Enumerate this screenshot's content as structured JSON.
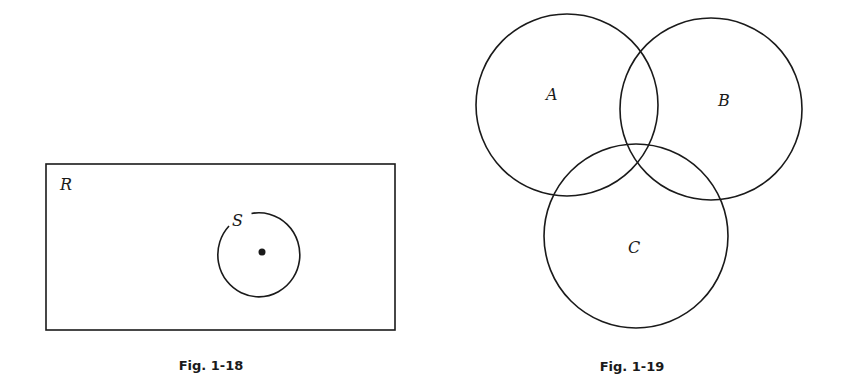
{
  "figures": [
    {
      "id": "fig-1-18",
      "caption": "Fig. 1-18",
      "region_label": "R",
      "set_label": "S",
      "has_center_point": true
    },
    {
      "id": "fig-1-19",
      "caption": "Fig. 1-19",
      "sets": [
        {
          "label": "A"
        },
        {
          "label": "B"
        },
        {
          "label": "C"
        }
      ]
    }
  ]
}
